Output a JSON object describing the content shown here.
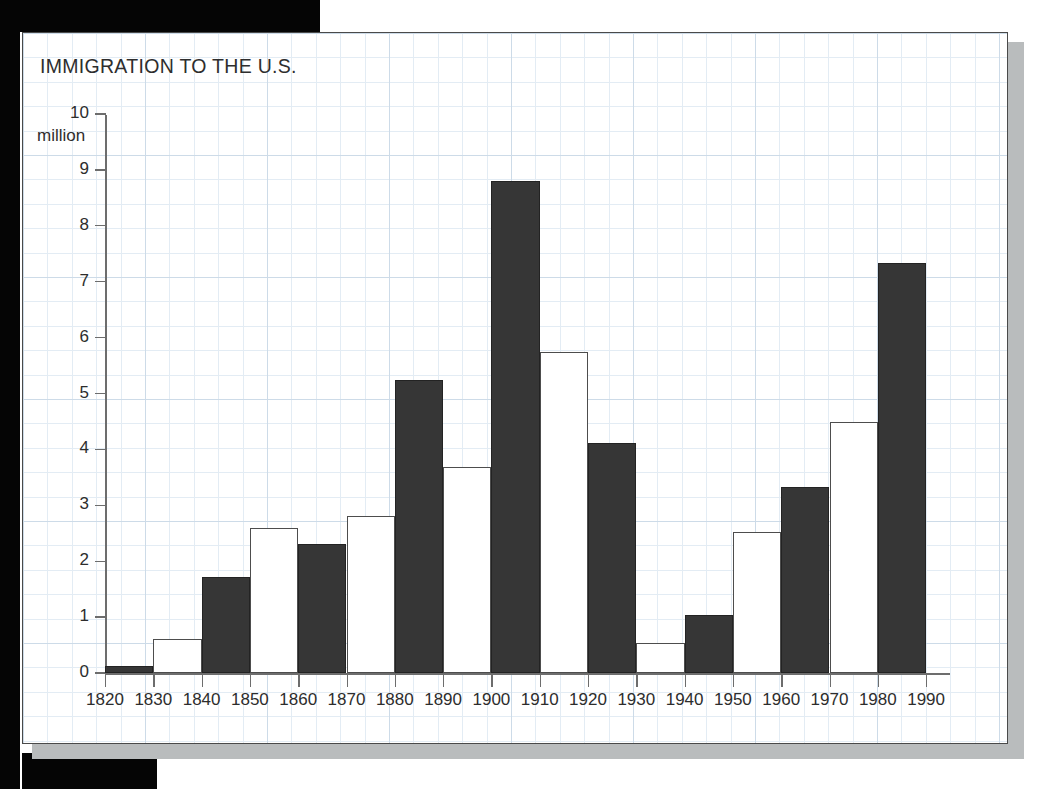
{
  "chart_data": {
    "type": "bar",
    "title": "IMMIGRATION TO THE U.S.",
    "xlabel": "",
    "ylabel": "million",
    "ylim": [
      0,
      10
    ],
    "grid": "graph-paper light blue minor and major gridlines",
    "legend": "none",
    "y_unit_label": "million",
    "y_ticks": [
      "0",
      "1",
      "2",
      "3",
      "4",
      "5",
      "6",
      "7",
      "8",
      "9",
      "10"
    ],
    "y_tick_values": [
      0,
      1,
      2,
      3,
      4,
      5,
      6,
      7,
      8,
      9,
      10
    ],
    "x_ticks": [
      "1820",
      "1830",
      "1840",
      "1850",
      "1860",
      "1870",
      "1880",
      "1890",
      "1900",
      "1910",
      "1920",
      "1930",
      "1940",
      "1950",
      "1960",
      "1970",
      "1980",
      "1990"
    ],
    "categories": [
      "1820-1830",
      "1830-1840",
      "1840-1850",
      "1850-1860",
      "1860-1870",
      "1870-1880",
      "1880-1890",
      "1890-1900",
      "1900-1910",
      "1910-1920",
      "1920-1930",
      "1930-1940",
      "1940-1950",
      "1950-1960",
      "1960-1970",
      "1970-1980",
      "1980-1990"
    ],
    "values": [
      0.13,
      0.6,
      1.71,
      2.6,
      2.31,
      2.81,
      5.25,
      3.69,
      8.8,
      5.74,
      4.11,
      0.53,
      1.04,
      2.52,
      3.32,
      4.49,
      7.34
    ],
    "bar_styles": [
      "dark",
      "light",
      "dark",
      "light",
      "dark",
      "light",
      "dark",
      "light",
      "dark",
      "light",
      "dark",
      "light",
      "dark",
      "light",
      "dark",
      "light",
      "dark"
    ],
    "colors": {
      "bar_dark": "#363636",
      "bar_light": "#ffffff",
      "bar_light_outline": "#4d4d4d",
      "axis": "#6d6d6d",
      "text": "#2d2d2d",
      "grid_minor": "#e3ecf4",
      "grid_major": "#cddbe8",
      "panel_border": "#4a4a4a",
      "panel_shadow": "#b9bcbd",
      "page_edge": "#050505"
    }
  }
}
